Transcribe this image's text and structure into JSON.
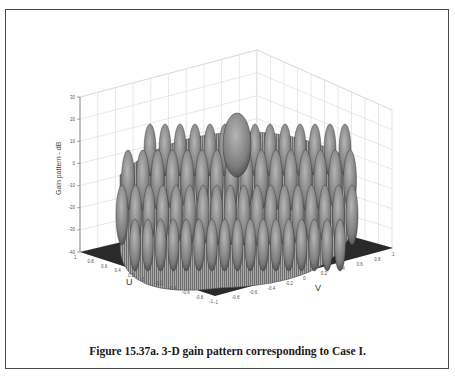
{
  "figure": {
    "caption": "Figure 15.37a. 3-D gain pattern corresponding to Case I."
  },
  "chart_data": {
    "type": "surface3d",
    "title": "",
    "zlabel": "Gain pattern - dB",
    "xlabel": "U",
    "ylabel": "V",
    "z_ticks": [
      30,
      20,
      10,
      0,
      -10,
      -20,
      -30,
      -40
    ],
    "zlim": [
      -40,
      30
    ],
    "u_ticks": [
      1,
      0.8,
      0.6,
      0.4,
      0.2,
      0,
      -0.2,
      -0.4,
      -0.6,
      -0.8,
      -1
    ],
    "v_ticks": [
      -1,
      -0.8,
      -0.6,
      -0.4,
      -0.2,
      0,
      0.2,
      0.4,
      0.6,
      0.8,
      1
    ],
    "ulim": [
      -1,
      1
    ],
    "vlim": [
      -1,
      1
    ],
    "grid": true,
    "peak_gain_db": 20,
    "sidelobe_level_db_approx": 8,
    "floor_db": -40
  }
}
